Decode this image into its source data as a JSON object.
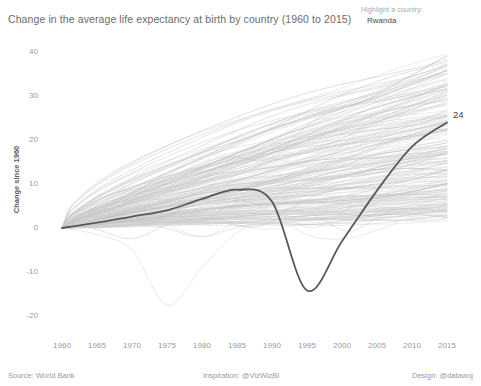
{
  "header": {
    "title": "Change in the average life expectancy at birth by country (1960 to 2015)"
  },
  "control": {
    "label": "Highlight a country:",
    "value": "Rwanda"
  },
  "footer": {
    "source": "Source: World Bank",
    "inspiration": "Inspiration: @VizWizBI",
    "design": "Design: @datawoj"
  },
  "annotations": {
    "endpoint_value": "24"
  },
  "colors": {
    "background": "#ffffff",
    "highlight_line": "#595959",
    "context_line": "#c9c9c9",
    "outlier_line": "#eaeaea",
    "text_primary": "#6b6b6b",
    "text_muted": "#9a9a9a",
    "axis_label": "#5c5c5c"
  },
  "chart_data": {
    "type": "line",
    "title": "Change in the average life expectancy at birth by country (1960 to 2015)",
    "xlabel": "",
    "ylabel": "Change since 1960",
    "xlim": [
      1960,
      2015
    ],
    "ylim": [
      -23,
      42
    ],
    "grid": false,
    "legend": "none",
    "x_ticks": [
      1960,
      1965,
      1970,
      1975,
      1980,
      1985,
      1990,
      1995,
      2000,
      2005,
      2010,
      2015
    ],
    "y_ticks": [
      40,
      30,
      20,
      10,
      0,
      -10,
      -20
    ],
    "x": [
      1960,
      1965,
      1970,
      1975,
      1980,
      1985,
      1990,
      1995,
      2000,
      2005,
      2010,
      2015
    ],
    "highlight_series": {
      "name": "Rwanda",
      "color": "#595959",
      "end_label": "24",
      "values": [
        0,
        1.2,
        2.6,
        4.0,
        6.6,
        8.7,
        6.0,
        -14.2,
        -3.0,
        8.5,
        18.5,
        24.0
      ]
    },
    "series": [
      {
        "name": "context-top-1",
        "values": [
          0,
          5.5,
          11.0,
          16.5,
          21.5,
          26.0,
          29.5,
          32.5,
          35.0,
          36.8,
          38.0,
          38.8
        ]
      },
      {
        "name": "context-top-2",
        "values": [
          0,
          5.0,
          10.2,
          15.0,
          19.5,
          23.5,
          26.5,
          29.0,
          31.0,
          32.5,
          33.6,
          34.3
        ]
      },
      {
        "name": "context-top-3",
        "values": [
          0,
          4.2,
          8.6,
          12.8,
          16.8,
          20.2,
          23.2,
          25.8,
          28.0,
          29.8,
          31.2,
          32.2
        ]
      },
      {
        "name": "context-band-median",
        "values": [
          0,
          3.2,
          6.4,
          9.6,
          12.6,
          15.2,
          17.6,
          19.6,
          21.4,
          22.8,
          24.0,
          25.0
        ]
      },
      {
        "name": "context-band-lower",
        "values": [
          0,
          2.0,
          4.0,
          6.0,
          8.0,
          9.8,
          11.4,
          12.8,
          14.2,
          15.4,
          16.4,
          17.2
        ]
      },
      {
        "name": "context-low",
        "values": [
          0,
          1.0,
          2.2,
          3.2,
          4.2,
          5.0,
          5.6,
          6.2,
          7.0,
          8.0,
          9.2,
          10.2
        ]
      },
      {
        "name": "context-flat",
        "values": [
          0,
          0.5,
          1.0,
          1.5,
          1.8,
          2.0,
          1.8,
          1.4,
          1.2,
          1.6,
          2.4,
          3.2
        ]
      },
      {
        "name": "outlier-cambodia",
        "values": [
          0,
          -1.5,
          -5.0,
          -17.5,
          -9.0,
          -1.0,
          2.0,
          4.0,
          7.0,
          10.0,
          12.5,
          14.0
        ]
      },
      {
        "name": "outlier-dip-1990s",
        "values": [
          0,
          1.5,
          3.0,
          4.5,
          5.5,
          5.8,
          3.5,
          -1.5,
          -2.5,
          -0.5,
          2.5,
          5.0
        ]
      }
    ],
    "context_line_count": 190,
    "note": "Grey spaghetti lines represent all other countries; the dark line is the highlighted country (Rwanda)."
  }
}
